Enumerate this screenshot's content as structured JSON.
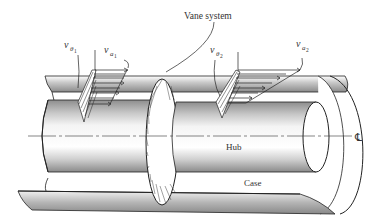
{
  "figure": {
    "labels": {
      "vane_system": "Vane system",
      "hub": "Hub",
      "case": "Case",
      "centerline": "℄"
    },
    "velocity_labels": {
      "v_theta1": {
        "main": "v",
        "sub": "θ",
        "subsub": "1"
      },
      "v_a1": {
        "main": "v",
        "sub": "a",
        "subsub": "1"
      },
      "v_theta2": {
        "main": "v",
        "sub": "θ",
        "subsub": "2"
      },
      "v_a2": {
        "main": "v",
        "sub": "a",
        "subsub": "2"
      }
    },
    "colors": {
      "line": "#222222",
      "shade_dark": "#9a9a9a",
      "shade_light": "#d8d8d8",
      "background": "#ffffff"
    }
  }
}
